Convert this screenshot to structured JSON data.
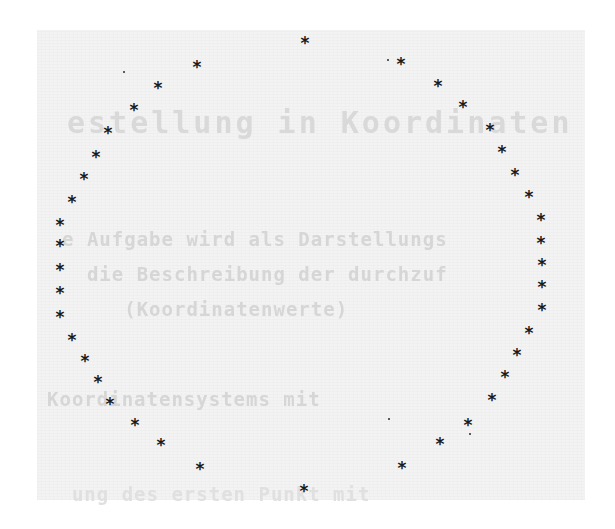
{
  "page": {
    "background": "#f3f3f3",
    "ink": "#1a1a1a",
    "ghost_text_lines": [
      "estellung in Koordinaten",
      "e Aufgabe wird als Darstellungs",
      "  die Beschreibung der durchzuf",
      "     (Koordinatenwerte)",
      "Koordinatensystems mit",
      "  ung des ersten Punkt mit"
    ]
  },
  "figure": {
    "marker": "*",
    "points": [
      [
        305,
        43
      ],
      [
        401,
        64
      ],
      [
        438,
        86
      ],
      [
        463,
        107
      ],
      [
        490,
        130
      ],
      [
        502,
        152
      ],
      [
        515,
        175
      ],
      [
        529,
        197
      ],
      [
        541,
        220
      ],
      [
        541,
        243
      ],
      [
        542,
        265
      ],
      [
        542,
        287
      ],
      [
        542,
        310
      ],
      [
        529,
        333
      ],
      [
        517,
        355
      ],
      [
        505,
        377
      ],
      [
        492,
        400
      ],
      [
        468,
        425
      ],
      [
        440,
        444
      ],
      [
        402,
        468
      ],
      [
        304,
        491
      ],
      [
        200,
        469
      ],
      [
        161,
        445
      ],
      [
        135,
        425
      ],
      [
        110,
        404
      ],
      [
        98,
        382
      ],
      [
        85,
        361
      ],
      [
        72,
        340
      ],
      [
        60,
        317
      ],
      [
        60,
        293
      ],
      [
        60,
        270
      ],
      [
        60,
        246
      ],
      [
        60,
        225
      ],
      [
        72,
        202
      ],
      [
        84,
        179
      ],
      [
        96,
        157
      ],
      [
        108,
        133
      ],
      [
        134,
        110
      ],
      [
        158,
        88
      ],
      [
        197,
        67
      ]
    ],
    "specks": [
      [
        123,
        71
      ],
      [
        387,
        59
      ],
      [
        388,
        418
      ],
      [
        469,
        433
      ]
    ]
  }
}
